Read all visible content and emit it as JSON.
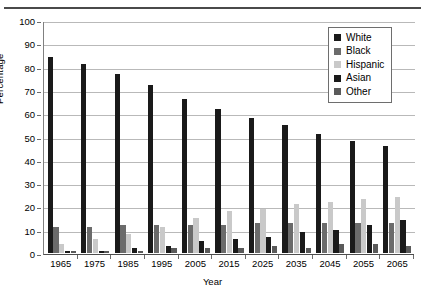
{
  "chart_data": {
    "type": "bar",
    "title": "",
    "xlabel": "Year",
    "ylabel": "Percentage",
    "ylim": [
      0,
      100
    ],
    "ytick_step": 10,
    "yticks": [
      0,
      10,
      20,
      30,
      40,
      50,
      60,
      70,
      80,
      90,
      100
    ],
    "grid": true,
    "legend_position": "top-right",
    "categories": [
      "1965",
      "1975",
      "1985",
      "1995",
      "2005",
      "2015",
      "2025",
      "2035",
      "2045",
      "2055",
      "2065"
    ],
    "series": [
      {
        "name": "White",
        "color": "#1a1a1a",
        "values": [
          84,
          81,
          77,
          72,
          66,
          62,
          58,
          55,
          51,
          48,
          46
        ]
      },
      {
        "name": "Black",
        "color": "#6b6b6b",
        "values": [
          11,
          11,
          12,
          12,
          12,
          12,
          13,
          13,
          13,
          13,
          13
        ]
      },
      {
        "name": "Hispanic",
        "color": "#c9c9c9",
        "values": [
          4,
          6,
          8,
          11,
          15,
          18,
          19,
          21,
          22,
          23,
          24
        ]
      },
      {
        "name": "Asian",
        "color": "#1a1a1a",
        "values": [
          1,
          1,
          2,
          3,
          5,
          6,
          7,
          9,
          10,
          12,
          14
        ]
      },
      {
        "name": "Other",
        "color": "#5a5a5a",
        "values": [
          1,
          1,
          1,
          2,
          2,
          2,
          3,
          2,
          4,
          4,
          3
        ]
      }
    ]
  },
  "legend": {
    "items": [
      {
        "label": "White"
      },
      {
        "label": "Black"
      },
      {
        "label": "Hispanic"
      },
      {
        "label": "Asian"
      },
      {
        "label": "Other"
      }
    ]
  },
  "axes": {
    "y_title": "Percentage",
    "x_title": "Year"
  }
}
